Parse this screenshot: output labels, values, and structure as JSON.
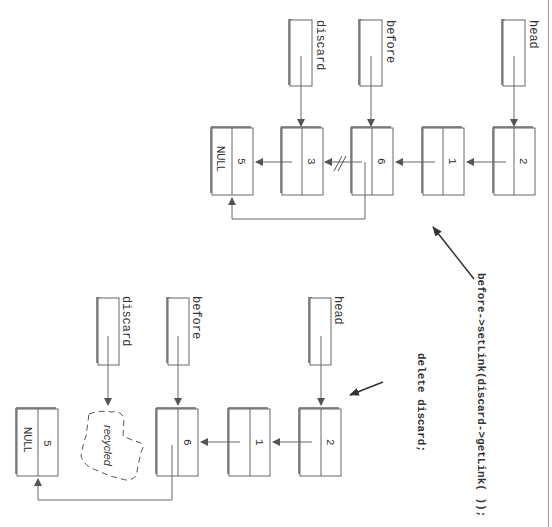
{
  "colors": {
    "line": "#666666",
    "shadow": "#8c8c8c",
    "text": "#333333",
    "frame": "#9a9a9a",
    "background": "#ffffff"
  },
  "code": {
    "set_link": "before->setLink(discard->getLink( ));",
    "delete": "delete discard;"
  },
  "top_diagram": {
    "pointers": [
      {
        "label": "head",
        "points_to": "2"
      },
      {
        "label": "before",
        "points_to": "6"
      },
      {
        "label": "discard",
        "points_to": "3"
      }
    ],
    "nodes": [
      {
        "value": "2",
        "link": ""
      },
      {
        "value": "1",
        "link": ""
      },
      {
        "value": "6",
        "link": ""
      },
      {
        "value": "3",
        "link": ""
      },
      {
        "value": "5",
        "link": "NULL"
      }
    ],
    "broken_link_marker": "//"
  },
  "bottom_diagram": {
    "pointers": [
      {
        "label": "head",
        "points_to": "2"
      },
      {
        "label": "before",
        "points_to": "6"
      },
      {
        "label": "discard",
        "points_to": "recycled"
      }
    ],
    "nodes": [
      {
        "value": "2",
        "link": ""
      },
      {
        "value": "1",
        "link": ""
      },
      {
        "value": "6",
        "link": ""
      },
      {
        "value": "5",
        "link": "NULL"
      }
    ],
    "recycled_label": "recycled"
  }
}
